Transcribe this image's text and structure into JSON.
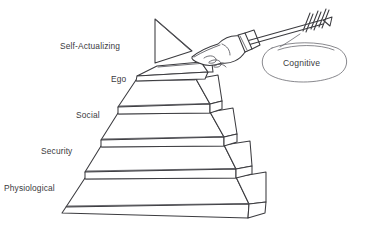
{
  "diagram": {
    "style": "hand-drawn line sketch",
    "background_color": "#ffffff",
    "ink_color": "#3b3b3f",
    "text_color": "#3a3a40"
  },
  "pyramid": {
    "tier_count": 5,
    "tiers": [
      {
        "label": "Self-Actualizing",
        "level": 5,
        "label_x": 60,
        "label_y": 41
      },
      {
        "label": "Ego",
        "level": 4,
        "label_x": 111,
        "label_y": 74
      },
      {
        "label": "Social",
        "level": 3,
        "label_x": 76,
        "label_y": 110
      },
      {
        "label": "Security",
        "level": 2,
        "label_x": 41,
        "label_y": 146
      },
      {
        "label": "Physiological",
        "level": 1,
        "label_x": 4,
        "label_y": 183
      }
    ]
  },
  "callout": {
    "label": "Cognitive",
    "shape": "ellipse",
    "label_x": 283,
    "label_y": 58
  },
  "annotations": {
    "flag_icon": "triangle-pennant",
    "hand_icon": "pointing-hand",
    "arrow_icon": "fletched-arrow"
  }
}
